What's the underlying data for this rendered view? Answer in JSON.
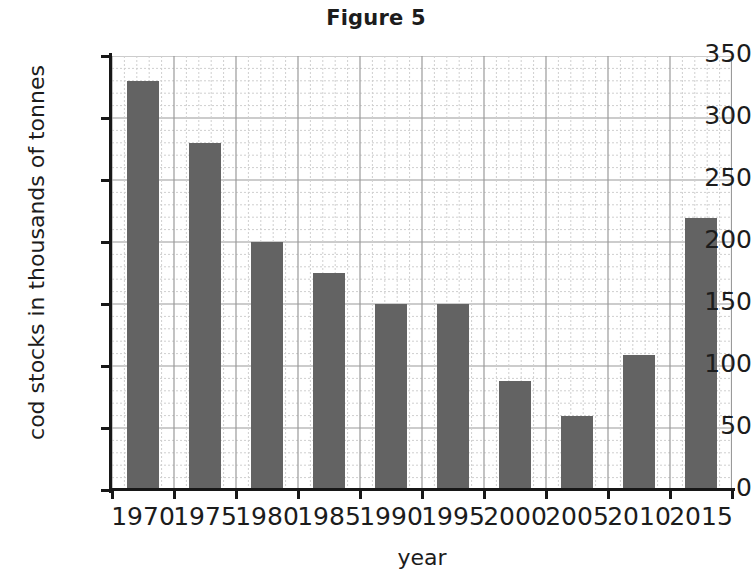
{
  "chart_data": {
    "type": "bar",
    "title": "Figure 5",
    "xlabel": "year",
    "ylabel": "cod stocks in thousands of tonnes",
    "categories": [
      "1970",
      "1975",
      "1980",
      "1985",
      "1990",
      "1995",
      "2000",
      "2005",
      "2010",
      "2015"
    ],
    "values": [
      330,
      280,
      200,
      175,
      150,
      150,
      88,
      60,
      109,
      219
    ],
    "ylim": [
      0,
      350
    ],
    "y_ticks": [
      0,
      50,
      100,
      150,
      200,
      250,
      300,
      350
    ],
    "y_tick_labels": [
      "0",
      "50",
      "100",
      "150",
      "200",
      "250",
      "300",
      "350"
    ],
    "x_tick_labels": [
      "1970",
      "1975",
      "1980",
      "1985",
      "1990",
      "1995",
      "2000",
      "2005",
      "2010",
      "2015"
    ],
    "grid": true,
    "grid_major_step": 50,
    "grid_minor_step": 10,
    "legend": "none",
    "bar_color": "#636363",
    "axis_color": "#171717",
    "grid_major_color": "#9a9a9a",
    "grid_minor_color": "#cfcfcf",
    "background_color": "#ffffff"
  }
}
